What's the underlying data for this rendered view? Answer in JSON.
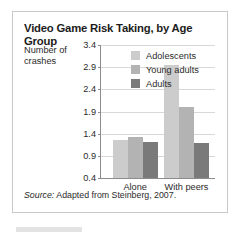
{
  "figure": {
    "title": "Video Game Risk Taking, by Age Group",
    "y_axis_caption": "Number of crashes",
    "source_prefix": "Source:",
    "source_text": " Adapted from Steinberg, 2007."
  },
  "colors": {
    "adolescents": "#cccccc",
    "young_adults": "#b3b3b3",
    "adults": "#7a7a7a",
    "gridline": "#d8d8d8",
    "axis": "#8c8c8c",
    "frame": "#c9c9c9",
    "text": "#2b2b2b",
    "title": "#1d1d1d"
  },
  "chart_data": {
    "type": "bar",
    "title": "Video Game Risk Taking, by Age Group",
    "xlabel": "",
    "ylabel": "Number of crashes",
    "categories": [
      "Alone",
      "With peers"
    ],
    "series": [
      {
        "name": "Adolescents",
        "values": [
          1.25,
          2.95
        ]
      },
      {
        "name": "Young adults",
        "values": [
          1.33,
          2.0
        ]
      },
      {
        "name": "Adults",
        "values": [
          1.22,
          1.2
        ]
      }
    ],
    "ylim": [
      0.4,
      3.4
    ],
    "yticks": [
      3.4,
      2.9,
      2.4,
      1.9,
      1.4,
      0.9,
      0.4
    ],
    "ytick_labels": [
      "3.4",
      "2.9",
      "2.4",
      "1.9",
      "1.4",
      "0.9",
      "0.4"
    ],
    "grid": true,
    "legend_position": "top-left-inside",
    "source": "Source: Adapted from Steinberg, 2007."
  }
}
